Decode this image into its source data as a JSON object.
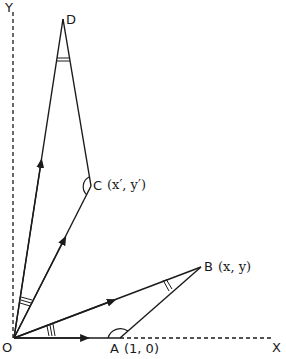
{
  "diagram": {
    "colors": {
      "stroke": "#1a1a1a",
      "background": "#ffffff"
    },
    "axes": {
      "x_label": "X",
      "y_label": "Y"
    },
    "points": {
      "O": {
        "label": "O",
        "coords": ""
      },
      "A": {
        "label": "A",
        "coords": "(1, 0)"
      },
      "B": {
        "label": "B",
        "coords": "(x, y)"
      },
      "C": {
        "label": "C",
        "coords": "(x′, y′)"
      },
      "D": {
        "label": "D",
        "coords": ""
      }
    },
    "segments": [
      {
        "from": "O",
        "to": "A",
        "arrow": true
      },
      {
        "from": "O",
        "to": "B",
        "arrow": true
      },
      {
        "from": "A",
        "to": "B",
        "arrow": false
      },
      {
        "from": "O",
        "to": "C",
        "arrow": true
      },
      {
        "from": "O",
        "to": "D",
        "arrow": true
      },
      {
        "from": "C",
        "to": "D",
        "arrow": false
      }
    ],
    "angle_marks": [
      {
        "at": "O",
        "between": "OA-OB",
        "ticks": 3
      },
      {
        "at": "O",
        "between": "OC-OD",
        "ticks": 3
      },
      {
        "at": "B",
        "ticks": 2
      },
      {
        "at": "D",
        "ticks": 2
      },
      {
        "at": "A",
        "type": "arc"
      },
      {
        "at": "C",
        "type": "arc"
      }
    ]
  }
}
